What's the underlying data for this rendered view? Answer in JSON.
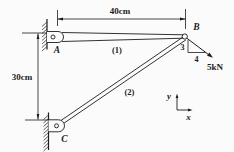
{
  "figure": {
    "colors": {
      "ink": "#1c1c1c",
      "paper": "#fbfbfb"
    },
    "dimensions": {
      "top": "40cm",
      "left": "30cm"
    },
    "nodes": {
      "a": "A",
      "b": "B",
      "c": "C"
    },
    "members": {
      "m1": "(1)",
      "m2": "(2)"
    },
    "force": {
      "label": "5kN",
      "slope_rise": "3",
      "slope_run": "4"
    },
    "axes": {
      "x": "x",
      "y": "y"
    }
  }
}
